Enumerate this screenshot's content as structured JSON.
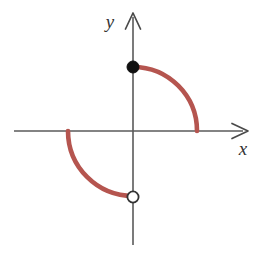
{
  "figure": {
    "width": 263,
    "height": 254,
    "background_color": "#FFFFFF"
  },
  "axes": {
    "x_axis": {
      "label": "x",
      "color": "#5A5A5A",
      "start_x": 14,
      "end_x": 247,
      "y": 131,
      "arrow": "right",
      "label_x": 243,
      "label_y": 155
    },
    "y_axis": {
      "label": "y",
      "color": "#5A5A5A",
      "x": 133,
      "start_y": 13,
      "end_y": 245,
      "arrow": "up",
      "label_x": 110,
      "label_y": 28
    },
    "origin": {
      "x": 133,
      "y": 131
    }
  },
  "curve": {
    "color": "#B5554F",
    "stroke_width": 4.6,
    "upper_arc": {
      "name": "first-quadrant-quarter-arc",
      "path": "M 133 67 A 64 64 0 0 1 197 131",
      "radius": 64,
      "start_point": {
        "x": 133,
        "y": 67
      },
      "end_point": {
        "x": 197,
        "y": 131
      }
    },
    "lower_arc": {
      "name": "third-quadrant-quarter-arc",
      "path": "M 68 131 A 65 65 0 0 0 133 196",
      "radius": 65,
      "start_point": {
        "x": 68,
        "y": 131
      },
      "end_point": {
        "x": 133,
        "y": 196
      }
    }
  },
  "endpoints": {
    "closed": {
      "name": "filled-endpoint",
      "x": 133,
      "y": 67,
      "radius": 6,
      "fill": "#101010",
      "stroke": "#101010",
      "meaning": "included endpoint"
    },
    "open": {
      "name": "open-endpoint",
      "x": 133,
      "y": 197,
      "radius": 6,
      "fill": "#FFFFFF",
      "stroke": "#333333",
      "meaning": "excluded endpoint"
    }
  },
  "chart_data": {
    "type": "line",
    "title": "",
    "xlabel": "x",
    "ylabel": "y",
    "grid": false,
    "legend": null,
    "xlim": [
      -2.1,
      2.1
    ],
    "ylim": [
      -2.1,
      2.1
    ],
    "series": [
      {
        "name": "upper quarter circle (quadrant I)",
        "description": "Quarter circle of radius 1 centered at the origin, traced from (0, 1) down to (1, 0).",
        "x": [
          0.0,
          0.17,
          0.34,
          0.5,
          0.64,
          0.77,
          0.87,
          0.94,
          0.98,
          1.0
        ],
        "y": [
          1.0,
          0.98,
          0.94,
          0.87,
          0.77,
          0.64,
          0.5,
          0.34,
          0.17,
          0.0
        ]
      },
      {
        "name": "lower quarter circle (quadrant III)",
        "description": "Quarter circle of radius 1 centered at the origin, traced from (-1, 0) down to (0, -1).",
        "x": [
          -1.0,
          -0.98,
          -0.94,
          -0.87,
          -0.77,
          -0.64,
          -0.5,
          -0.34,
          -0.17,
          0.0
        ],
        "y": [
          0.0,
          -0.17,
          -0.34,
          -0.5,
          -0.64,
          -0.77,
          -0.87,
          -0.94,
          -0.98,
          -1.0
        ]
      }
    ],
    "annotations": [
      {
        "type": "closed-circle",
        "x": 0,
        "y": 1,
        "label": "included endpoint at (0, 1)"
      },
      {
        "type": "open-circle",
        "x": 0,
        "y": -1,
        "label": "excluded endpoint at (0, -1)"
      }
    ]
  }
}
